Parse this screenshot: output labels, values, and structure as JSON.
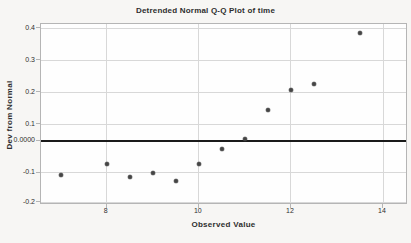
{
  "colors": {
    "background": "#f7f6f4",
    "plot_background": "#fefefe",
    "frame": "#b5b5b5",
    "grid": "#d8d8d8",
    "zero_line": "#1a1a1a",
    "point": "#454545",
    "text": "#2e2e2e"
  },
  "chart_data": {
    "type": "scatter",
    "title": "Detrended Normal Q-Q Plot of time",
    "xlabel": "Observed Value",
    "ylabel": "Dev from Normal",
    "x_ticks": [
      {
        "label": "8",
        "value": 8
      },
      {
        "label": "10",
        "value": 10
      },
      {
        "label": "12",
        "value": 12
      },
      {
        "label": "14",
        "value": 14
      }
    ],
    "y_ticks": [
      {
        "label": "0.4",
        "value": 0.4
      },
      {
        "label": "0.3",
        "value": 0.3
      },
      {
        "label": "0.2",
        "value": 0.2
      },
      {
        "label": "0.1",
        "value": 0.1
      },
      {
        "label": "0.0000",
        "value": 0.0
      },
      {
        "label": "-0.1",
        "value": -0.1
      },
      {
        "label": "-0.2",
        "value": -0.2
      }
    ],
    "reference_line_y": 0.0,
    "x_range": [
      6.55,
      14.55
    ],
    "y_range": [
      -0.215,
      0.41
    ],
    "grid": true,
    "legend": "none",
    "points": [
      {
        "x": 7.0,
        "y": -0.108
      },
      {
        "x": 8.0,
        "y": -0.072
      },
      {
        "x": 8.5,
        "y": -0.115
      },
      {
        "x": 9.0,
        "y": -0.101
      },
      {
        "x": 9.5,
        "y": -0.129
      },
      {
        "x": 10.0,
        "y": -0.074
      },
      {
        "x": 10.5,
        "y": -0.027
      },
      {
        "x": 11.0,
        "y": 0.012
      },
      {
        "x": 11.5,
        "y": 0.143
      },
      {
        "x": 12.0,
        "y": 0.205
      },
      {
        "x": 12.5,
        "y": 0.226
      },
      {
        "x": 13.5,
        "y": 0.385
      }
    ]
  }
}
